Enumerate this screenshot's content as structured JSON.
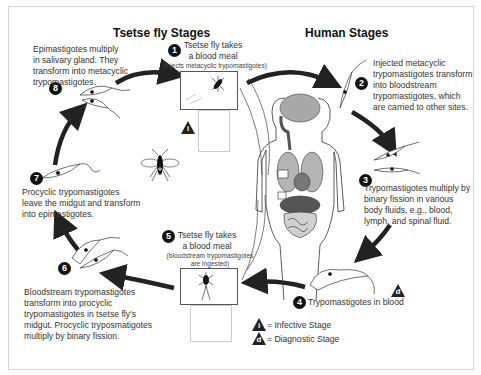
{
  "titles": {
    "tsetse": "Tsetse fly Stages",
    "human": "Human Stages"
  },
  "stages": [
    {
      "num": "1",
      "title_line1": "Tsetse fly takes",
      "title_line2": "a blood meal",
      "note": "(injects metacyclic trypomastigotes)"
    },
    {
      "num": "2",
      "text": [
        "Injected metacyclic",
        "trypomastigotes transform",
        "into bloodstream",
        "trypomastigotes, which",
        "are carried to other sites."
      ]
    },
    {
      "num": "3",
      "text": [
        "Trypomastigotes multiply by",
        "binary fission in various",
        "body fluids, e.g., blood,",
        "lymph, and spinal fluid."
      ]
    },
    {
      "num": "4",
      "text": [
        "Trypomastigotes in blood"
      ]
    },
    {
      "num": "5",
      "title_line1": "Tsetse fly takes",
      "title_line2": "a blood meal",
      "note_line1": "(bloodstream trypomastigotes",
      "note_line2": "are ingested)"
    },
    {
      "num": "6",
      "text": [
        "Bloodstream trypomastigotes",
        "transform into procyclic",
        "trypomastigotes in tsetse fly's",
        "midgut. Procyclic tryposmatigotes",
        "multiply by binary fission."
      ]
    },
    {
      "num": "7",
      "text": [
        "Procyclic trypomastigotes",
        "leave the midgut and transform",
        "into epimastigotes."
      ]
    },
    {
      "num": "8",
      "text": [
        "Epimastigotes multiply",
        "in salivary gland. They",
        "transform into metacyclic",
        "trypomastigotes."
      ]
    }
  ],
  "legend": {
    "infective_symbol": "i",
    "infective_label": "= Infective Stage",
    "diagnostic_symbol": "d",
    "diagnostic_label": "= Diagnostic Stage"
  },
  "colors": {
    "arrow": "#222222",
    "organ_dark": "#555555",
    "organ_light": "#a8a8a8",
    "frame": "#d4d4d4"
  }
}
